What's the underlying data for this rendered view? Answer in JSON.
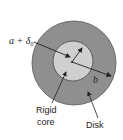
{
  "diagram": {
    "type": "annular-disk-on-rigid-core",
    "colors": {
      "background": "#ffffff",
      "disk_fill": "#8f8f8f",
      "core_fill": "#cfcfcf",
      "stroke": "#333333",
      "text": "#222222"
    },
    "labels": {
      "inner_radius": "a + δ",
      "inner_radius_subscript": "0",
      "outer_radius": "b",
      "core_line1": "Rigid",
      "core_line2": "core",
      "disk": "Disk"
    }
  }
}
